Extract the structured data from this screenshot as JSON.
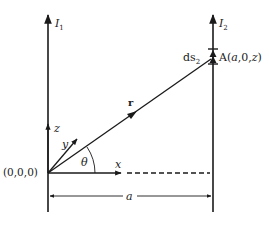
{
  "diagram": {
    "wire1": {
      "label": "I",
      "subscript": "1"
    },
    "wire2": {
      "label": "I",
      "subscript": "2"
    },
    "origin_label": "(0,0,0)",
    "point_A": {
      "prefix": "A(",
      "a": "a",
      "mid": ",0,",
      "z": "z",
      "suffix": ")"
    },
    "ds_label": {
      "base": "ds",
      "subscript": "2"
    },
    "r_label": "r",
    "theta_label": "θ",
    "axes": {
      "x": "x",
      "y": "y",
      "z": "z"
    },
    "dimension_label": "a",
    "colors": {
      "line": "#1a1a1a",
      "text": "#222222",
      "background": "#ffffff"
    }
  }
}
